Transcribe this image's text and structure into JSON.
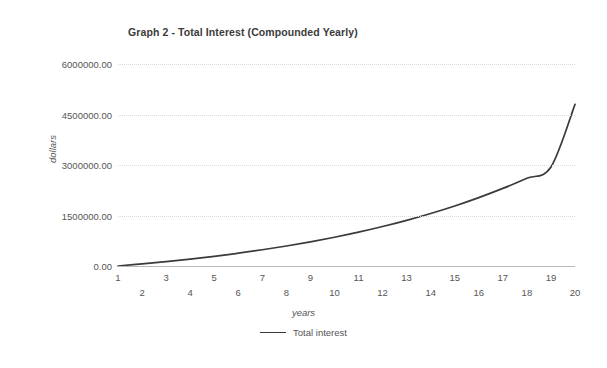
{
  "chart_data": {
    "type": "line",
    "title": "Graph 2 - Total Interest (Compounded Yearly)",
    "xlabel": "years",
    "ylabel": "dollars",
    "grid": "horizontal-dotted",
    "legend_position": "bottom-center",
    "line_color": "#3a3a3a",
    "xlim": [
      1,
      20
    ],
    "ylim": [
      0,
      6000000
    ],
    "ytick_labels": [
      "0.00",
      "1500000.00",
      "3000000.00",
      "4500000.00",
      "6000000.00"
    ],
    "ytick_values": [
      0,
      1500000,
      3000000,
      4500000,
      6000000
    ],
    "xtick_labels": [
      "1",
      "2",
      "3",
      "4",
      "5",
      "6",
      "7",
      "8",
      "9",
      "10",
      "11",
      "12",
      "13",
      "14",
      "15",
      "16",
      "17",
      "18",
      "19",
      "20"
    ],
    "x": [
      1,
      2,
      3,
      4,
      5,
      6,
      7,
      8,
      9,
      10,
      11,
      12,
      13,
      14,
      15,
      16,
      17,
      18,
      19,
      20
    ],
    "series": [
      {
        "name": "Total interest",
        "values": [
          0,
          62000,
          130000,
          205000,
          288000,
          380000,
          482000,
          594000,
          718000,
          855000,
          1006000,
          1173000,
          1357000,
          1560000,
          1784000,
          2032000,
          2305000,
          2607000,
          2940000,
          4800000
        ]
      }
    ]
  },
  "legend": {
    "entries": [
      {
        "label": "Total interest",
        "color": "#3a3a3a"
      }
    ]
  }
}
